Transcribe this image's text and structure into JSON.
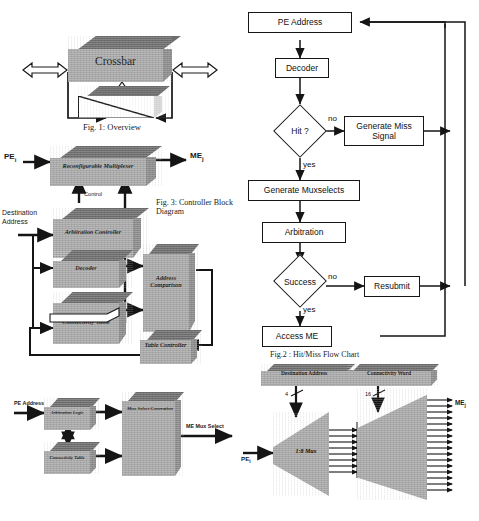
{
  "document": {
    "kind": "scanned-figure-page",
    "figure_count": 4
  },
  "fig1": {
    "caption": "Fig. 1: Overview",
    "crossbar_label": "Crossbar",
    "blocks": [
      "Crossbar",
      ""
    ],
    "arrows": [
      "left-bidirectional",
      "right-bidirectional",
      "up-hollow",
      "left-return",
      "right-return"
    ]
  },
  "fig2": {
    "caption": "Fig.2 : Hit/Miss Flow Chart",
    "nodes": [
      {
        "id": "pe_address",
        "label": "PE   Address",
        "type": "process"
      },
      {
        "id": "decoder",
        "label": "Decoder",
        "type": "process"
      },
      {
        "id": "hit",
        "label": "Hit ?",
        "type": "decision"
      },
      {
        "id": "generate_miss",
        "label": "Generate Miss\nSignal",
        "type": "process"
      },
      {
        "id": "generate_muxselects",
        "label": "Generate Muxselects",
        "type": "process"
      },
      {
        "id": "arbitration",
        "label": "Arbitration",
        "type": "process"
      },
      {
        "id": "success",
        "label": "Success",
        "type": "decision"
      },
      {
        "id": "resubmit",
        "label": "Resubmit",
        "type": "process"
      },
      {
        "id": "access_me",
        "label": "Access ME",
        "type": "process"
      }
    ],
    "edge_labels": {
      "hit_no": "no",
      "hit_yes": "yes",
      "success_no": "no",
      "success_yes": "yes"
    }
  },
  "fig3": {
    "caption": "Fig. 3: Controller Block\nDiagram",
    "blocks": [
      {
        "id": "reconfigurable_mux",
        "label": "Reconfigurable\nMultiplexer"
      },
      {
        "id": "arbitration_controller",
        "label": "Arbitration\nController"
      },
      {
        "id": "decoder",
        "label": "Decoder"
      },
      {
        "id": "connectivity_table",
        "label": "Connectivity\nTable"
      },
      {
        "id": "address_comparison",
        "label": "Address\n\nComparison"
      },
      {
        "id": "table_controller",
        "label": "Table\nController"
      }
    ],
    "io_labels": {
      "pe_in": "PE",
      "pe_in_sub": "i",
      "me_out": "ME",
      "me_out_sub": "j",
      "destination_address": "Destination\nAddress",
      "control": "Control"
    }
  },
  "fig4": {
    "blocks": [
      {
        "id": "arbitration_logic",
        "label": "Arbitration Logic"
      },
      {
        "id": "connectivity_table",
        "label": "Connectivity Table"
      },
      {
        "id": "mux_select_generation",
        "label": "Mux\n\nSelect\n\nGeneration"
      }
    ],
    "io_labels": {
      "pe_address": "PE Address",
      "me_mux_select": "ME Mux Select"
    }
  },
  "fig5": {
    "blocks": [
      {
        "id": "destination_address",
        "label": "Destination Address"
      },
      {
        "id": "connectivity_word",
        "label": "Connectivity Word"
      },
      {
        "id": "mux",
        "label": "1:8 Mux"
      }
    ],
    "io_labels": {
      "pe_in": "PE",
      "pe_in_sub": "i",
      "me_out": "ME",
      "me_out_sub": "j"
    },
    "bus_widths": {
      "destination_address": "4",
      "connectivity_word": "16"
    },
    "fanout": {
      "mux_outputs": 8,
      "me_outputs": 16
    }
  }
}
